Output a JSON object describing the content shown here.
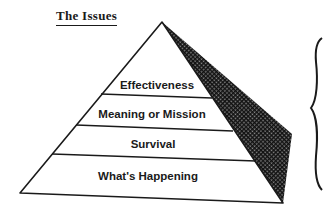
{
  "title": "The Issues",
  "pyramid": {
    "levels": [
      {
        "label": "Effectiveness"
      },
      {
        "label": "Meaning or Mission"
      },
      {
        "label": "Survival"
      },
      {
        "label": "What's Happening"
      }
    ],
    "shade_color": "#2a2a2a",
    "line_color": "#1a1a1a"
  },
  "brace": {
    "side": "right",
    "icon": "curly-brace-icon"
  }
}
